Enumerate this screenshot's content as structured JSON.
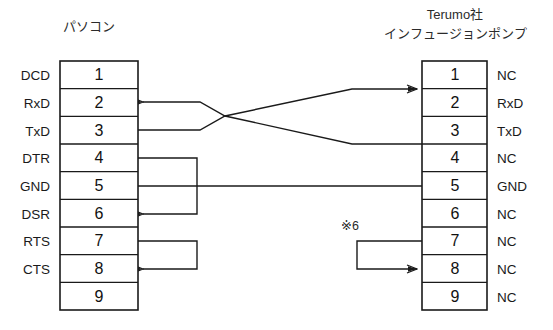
{
  "diagram": {
    "title_left": "パソコン",
    "title_right_line1": "Terumo社",
    "title_right_line2": "インフュージョンポンプ",
    "note_marker": "※6",
    "line_color": "#1a1a1a",
    "background_color": "#ffffff"
  },
  "left_connector": {
    "name": "パソコン",
    "pins": [
      {
        "number": "1",
        "signal": "DCD"
      },
      {
        "number": "2",
        "signal": "RxD"
      },
      {
        "number": "3",
        "signal": "TxD"
      },
      {
        "number": "4",
        "signal": "DTR"
      },
      {
        "number": "5",
        "signal": "GND"
      },
      {
        "number": "6",
        "signal": "DSR"
      },
      {
        "number": "7",
        "signal": "RTS"
      },
      {
        "number": "8",
        "signal": "CTS"
      },
      {
        "number": "9",
        "signal": ""
      }
    ]
  },
  "right_connector": {
    "name": "Terumo社 インフュージョンポンプ",
    "pins": [
      {
        "number": "1",
        "signal": "NC"
      },
      {
        "number": "2",
        "signal": "RxD"
      },
      {
        "number": "3",
        "signal": "TxD"
      },
      {
        "number": "4",
        "signal": "NC"
      },
      {
        "number": "5",
        "signal": "GND"
      },
      {
        "number": "6",
        "signal": "NC"
      },
      {
        "number": "7",
        "signal": "NC"
      },
      {
        "number": "8",
        "signal": "NC"
      },
      {
        "number": "9",
        "signal": "NC"
      }
    ]
  },
  "connections": [
    {
      "id": "cross-rxd",
      "from": "right.3",
      "to": "left.2",
      "style": "crossover",
      "arrow": "left"
    },
    {
      "id": "cross-txd",
      "from": "left.3",
      "to": "right.2",
      "style": "crossover",
      "arrow": "right"
    },
    {
      "id": "gnd",
      "from": "left.5",
      "to": "right.5",
      "style": "straight",
      "arrow": "none"
    },
    {
      "id": "dtr-dsr",
      "from": "left.4",
      "to": "left.6",
      "style": "loopback",
      "arrow": "left"
    },
    {
      "id": "rts-cts",
      "from": "left.7",
      "to": "left.8",
      "style": "loopback",
      "arrow": "left"
    },
    {
      "id": "pump-7-8",
      "from": "right.7",
      "to": "right.8",
      "style": "loopback",
      "arrow": "right",
      "note": "※6"
    }
  ]
}
